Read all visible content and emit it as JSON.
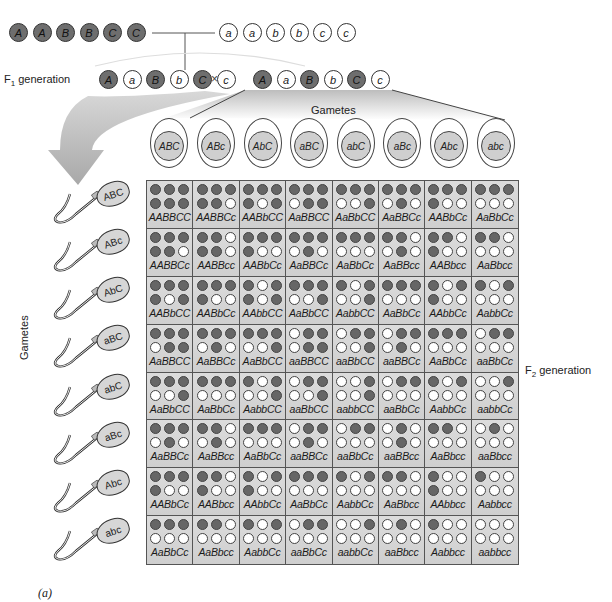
{
  "figure_label": "(a)",
  "parents": {
    "dominant": [
      "A",
      "A",
      "B",
      "B",
      "C",
      "C"
    ],
    "recessive": [
      "a",
      "a",
      "b",
      "b",
      "c",
      "c"
    ]
  },
  "f1": {
    "label": "F",
    "label_sub": "1",
    "label_suffix": " generation",
    "left": [
      "A",
      "a",
      "B",
      "b",
      "C",
      "c"
    ],
    "right": [
      "A",
      "a",
      "B",
      "b",
      "C",
      "c"
    ],
    "cross_symbol": "×"
  },
  "eggs": {
    "header": "Gametes",
    "items": [
      "ABC",
      "ABc",
      "AbC",
      "aBC",
      "abC",
      "aBc",
      "Abc",
      "abc"
    ]
  },
  "sperm": {
    "header": "Gametes",
    "items": [
      "ABC",
      "ABc",
      "AbC",
      "aBC",
      "abC",
      "aBc",
      "Abc",
      "abc"
    ]
  },
  "f2": {
    "label": "F",
    "label_sub": "2",
    "label_suffix": " generation"
  },
  "colors": {
    "dominant_fill": "#6e6e6e",
    "recessive_fill": "#ffffff",
    "cell_bg": "#d6d6d6",
    "egg_nucleus": "#cfcfcf"
  },
  "punnett": {
    "rows": [
      {
        "gamete": "ABC",
        "cells": [
          {
            "g": "AABBCC",
            "top": "111",
            "bot": "111"
          },
          {
            "g": "AABBCc",
            "top": "111",
            "bot": "110"
          },
          {
            "g": "AABbCC",
            "top": "111",
            "bot": "101"
          },
          {
            "g": "AaBBCC",
            "top": "111",
            "bot": "011"
          },
          {
            "g": "AaBbCC",
            "top": "111",
            "bot": "001"
          },
          {
            "g": "AaBBCc",
            "top": "111",
            "bot": "010"
          },
          {
            "g": "AABbCc",
            "top": "111",
            "bot": "100"
          },
          {
            "g": "AaBbCc",
            "top": "111",
            "bot": "000"
          }
        ]
      },
      {
        "gamete": "ABc",
        "cells": [
          {
            "g": "AABBCc",
            "top": "111",
            "bot": "110"
          },
          {
            "g": "AABBcc",
            "top": "110",
            "bot": "110"
          },
          {
            "g": "AABbCc",
            "top": "111",
            "bot": "100"
          },
          {
            "g": "AaBBCc",
            "top": "111",
            "bot": "010"
          },
          {
            "g": "AaBbCc",
            "top": "111",
            "bot": "000"
          },
          {
            "g": "AaBBcc",
            "top": "110",
            "bot": "010"
          },
          {
            "g": "AABbcc",
            "top": "110",
            "bot": "100"
          },
          {
            "g": "AaBbcc",
            "top": "110",
            "bot": "000"
          }
        ]
      },
      {
        "gamete": "AbC",
        "cells": [
          {
            "g": "AABbCC",
            "top": "111",
            "bot": "101"
          },
          {
            "g": "AABbCc",
            "top": "111",
            "bot": "100"
          },
          {
            "g": "AAbbCC",
            "top": "101",
            "bot": "101"
          },
          {
            "g": "AaBbCC",
            "top": "111",
            "bot": "001"
          },
          {
            "g": "AabbCC",
            "top": "101",
            "bot": "001"
          },
          {
            "g": "AaBbCc",
            "top": "111",
            "bot": "000"
          },
          {
            "g": "AAbbCc",
            "top": "101",
            "bot": "100"
          },
          {
            "g": "AabbCc",
            "top": "101",
            "bot": "000"
          }
        ]
      },
      {
        "gamete": "aBC",
        "cells": [
          {
            "g": "AaBBCC",
            "top": "111",
            "bot": "011"
          },
          {
            "g": "AaBBCc",
            "top": "111",
            "bot": "010"
          },
          {
            "g": "AaBbCC",
            "top": "111",
            "bot": "001"
          },
          {
            "g": "aaBBCC",
            "top": "011",
            "bot": "011"
          },
          {
            "g": "aaBbCC",
            "top": "011",
            "bot": "001"
          },
          {
            "g": "aaBBCc",
            "top": "011",
            "bot": "010"
          },
          {
            "g": "AaBbCc",
            "top": "111",
            "bot": "000"
          },
          {
            "g": "aaBbCc",
            "top": "011",
            "bot": "000"
          }
        ]
      },
      {
        "gamete": "abC",
        "cells": [
          {
            "g": "AaBbCC",
            "top": "111",
            "bot": "001"
          },
          {
            "g": "AaBbCc",
            "top": "111",
            "bot": "000"
          },
          {
            "g": "AabbCC",
            "top": "101",
            "bot": "001"
          },
          {
            "g": "aaBbCC",
            "top": "011",
            "bot": "001"
          },
          {
            "g": "aabbCC",
            "top": "001",
            "bot": "001"
          },
          {
            "g": "aaBbCc",
            "top": "011",
            "bot": "000"
          },
          {
            "g": "AabbCc",
            "top": "101",
            "bot": "000"
          },
          {
            "g": "aabbCc",
            "top": "001",
            "bot": "000"
          }
        ]
      },
      {
        "gamete": "aBc",
        "cells": [
          {
            "g": "AaBBCc",
            "top": "111",
            "bot": "010"
          },
          {
            "g": "AaBBcc",
            "top": "110",
            "bot": "010"
          },
          {
            "g": "AaBbCc",
            "top": "111",
            "bot": "000"
          },
          {
            "g": "aaBBCc",
            "top": "011",
            "bot": "010"
          },
          {
            "g": "aaBbCc",
            "top": "011",
            "bot": "000"
          },
          {
            "g": "aaBBcc",
            "top": "010",
            "bot": "010"
          },
          {
            "g": "AaBbcc",
            "top": "110",
            "bot": "000"
          },
          {
            "g": "aaBbcc",
            "top": "010",
            "bot": "000"
          }
        ]
      },
      {
        "gamete": "Abc",
        "cells": [
          {
            "g": "AABbCc",
            "top": "111",
            "bot": "100"
          },
          {
            "g": "AABbcc",
            "top": "110",
            "bot": "100"
          },
          {
            "g": "AAbbCc",
            "top": "101",
            "bot": "100"
          },
          {
            "g": "AaBbCc",
            "top": "111",
            "bot": "000"
          },
          {
            "g": "AabbCc",
            "top": "101",
            "bot": "000"
          },
          {
            "g": "AaBbcc",
            "top": "110",
            "bot": "000"
          },
          {
            "g": "AAbbcc",
            "top": "100",
            "bot": "100"
          },
          {
            "g": "Aabbcc",
            "top": "100",
            "bot": "000"
          }
        ]
      },
      {
        "gamete": "abc",
        "cells": [
          {
            "g": "AaBbCc",
            "top": "111",
            "bot": "000"
          },
          {
            "g": "AaBbcc",
            "top": "110",
            "bot": "000"
          },
          {
            "g": "AabbCc",
            "top": "101",
            "bot": "000"
          },
          {
            "g": "aaBbCc",
            "top": "011",
            "bot": "000"
          },
          {
            "g": "aabbCc",
            "top": "001",
            "bot": "000"
          },
          {
            "g": "aaBbcc",
            "top": "010",
            "bot": "000"
          },
          {
            "g": "Aabbcc",
            "top": "100",
            "bot": "000"
          },
          {
            "g": "aabbcc",
            "top": "000",
            "bot": "000"
          }
        ]
      }
    ]
  }
}
